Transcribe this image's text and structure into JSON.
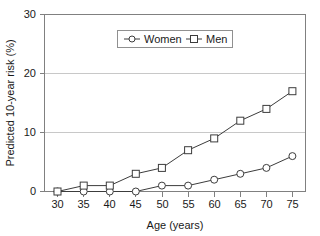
{
  "chart_data": {
    "type": "line",
    "title": "",
    "xlabel": "Age (years)",
    "ylabel": "Predicted 10-year risk (%)",
    "x": [
      30,
      35,
      40,
      45,
      50,
      55,
      60,
      65,
      70,
      75
    ],
    "xticklabels": [
      "30",
      "35",
      "40",
      "45",
      "50",
      "55",
      "60",
      "65",
      "70",
      "75"
    ],
    "yticklabels": [
      "0",
      "10",
      "20",
      "30"
    ],
    "yticks": [
      0,
      10,
      20,
      30
    ],
    "xlim": [
      27.5,
      77.5
    ],
    "ylim": [
      0,
      30
    ],
    "grid": "horizontal",
    "legend_position": "top-center",
    "series": [
      {
        "name": "Women",
        "marker": "circle",
        "values": [
          0,
          0,
          0,
          0,
          1,
          1,
          2,
          3,
          4,
          6
        ]
      },
      {
        "name": "Men",
        "marker": "square",
        "values": [
          0,
          1,
          1,
          3,
          4,
          7,
          9,
          12,
          14,
          17
        ]
      }
    ]
  },
  "colors": {
    "line": "#3c3c3c",
    "frame": "#808080",
    "grid": "#c8c8c8",
    "background": "#ffffff",
    "text": "#1a1a1a"
  },
  "legend": {
    "items": [
      {
        "label": "Women",
        "marker": "circle-marker"
      },
      {
        "label": "Men",
        "marker": "square-marker"
      }
    ]
  }
}
